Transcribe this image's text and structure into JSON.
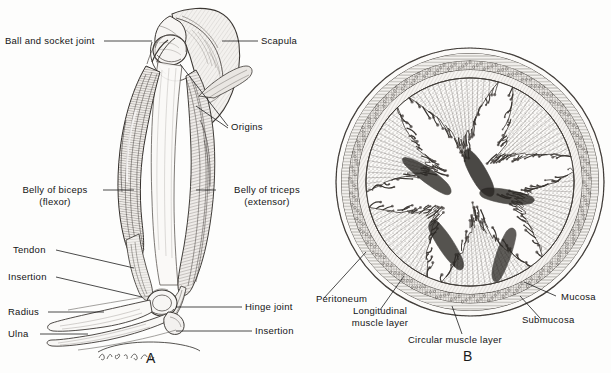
{
  "figure": {
    "background_color": "#fdfdfc",
    "ink_color": "#1d1d1d",
    "panels": [
      {
        "id": "A",
        "letter": "A",
        "subject": "human-arm-musculature-lever-system"
      },
      {
        "id": "B",
        "letter": "B",
        "subject": "small-intestine-cross-section"
      }
    ],
    "artist_signature": "J. A. Hulbert"
  },
  "panel_a": {
    "letter": "A",
    "labels": {
      "ball_and_socket_joint": "Ball and socket joint",
      "scapula": "Scapula",
      "origins": "Origins",
      "belly_of_biceps_line1": "Belly of biceps",
      "belly_of_biceps_line2": "(flexor)",
      "belly_of_triceps_line1": "Belly of triceps",
      "belly_of_triceps_line2": "(extensor)",
      "tendon": "Tendon",
      "insertion_left": "Insertion",
      "radius": "Radius",
      "ulna": "Ulna",
      "hinge_joint": "Hinge joint",
      "insertion_right": "Insertion"
    }
  },
  "panel_b": {
    "letter": "B",
    "labels": {
      "peritoneum": "Peritoneum",
      "longitudinal_muscle_layer_line1": "Longitudinal",
      "longitudinal_muscle_layer_line2": "muscle layer",
      "circular_muscle_layer": "Circular muscle layer",
      "mucosa": "Mucosa",
      "submucosa": "Submucosa"
    }
  }
}
